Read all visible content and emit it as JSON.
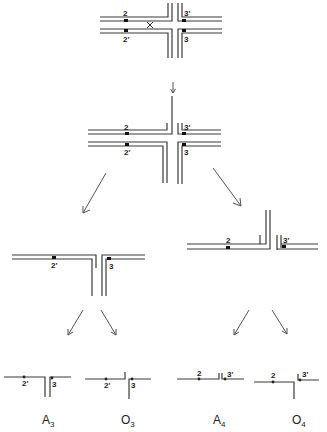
{
  "diagram": {
    "stage1": {
      "labels": {
        "top_left": "2",
        "bottom_left": "2'",
        "top_right": "3'",
        "bottom_right": "3"
      },
      "cut_mark": "X"
    },
    "stage2": {
      "labels": {
        "top_left": "2",
        "bottom_left": "2'",
        "top_right": "3'",
        "bottom_right": "3"
      }
    },
    "stage3_left": {
      "labels": {
        "left": "2'",
        "right": "3"
      }
    },
    "stage3_right": {
      "labels": {
        "left": "2",
        "right": "3'"
      }
    },
    "products": [
      {
        "id": "A3",
        "letter": "A",
        "subscript": "3",
        "labels": {
          "left": "2'",
          "right": "3"
        }
      },
      {
        "id": "O3",
        "letter": "O",
        "subscript": "3",
        "labels": {
          "left": "2'",
          "right": "3"
        }
      },
      {
        "id": "A4",
        "letter": "A",
        "subscript": "4",
        "labels": {
          "left": "2",
          "right": "3'"
        }
      },
      {
        "id": "O4",
        "letter": "O",
        "subscript": "4",
        "labels": {
          "left": "2",
          "right": "3'"
        }
      }
    ],
    "colors": {
      "line": "#3a3a3a",
      "marker": "#111111",
      "background": "#ffffff"
    }
  }
}
